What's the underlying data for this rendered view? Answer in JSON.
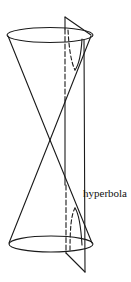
{
  "figure": {
    "label": "hyperbola",
    "colors": {
      "stroke": "#1a1a1a",
      "background": "#ffffff"
    },
    "elements": [
      {
        "name": "upper-nappe",
        "type": "cone"
      },
      {
        "name": "lower-nappe",
        "type": "cone"
      },
      {
        "name": "cutting-plane",
        "type": "plane"
      },
      {
        "name": "hyperbola-upper-branch",
        "type": "curve"
      },
      {
        "name": "hyperbola-lower-branch",
        "type": "curve"
      }
    ]
  }
}
